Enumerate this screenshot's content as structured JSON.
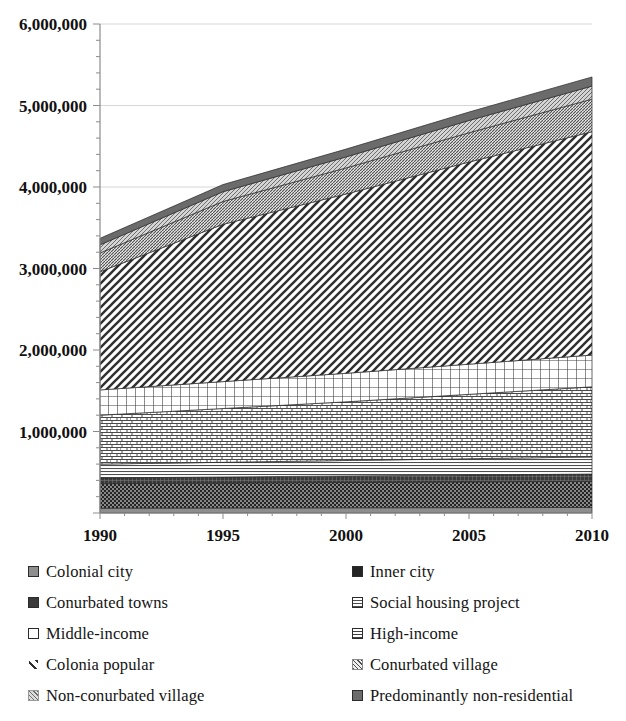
{
  "chart_data": {
    "type": "area",
    "stacked": true,
    "title": "",
    "xlabel": "",
    "ylabel": "",
    "x": [
      1990,
      1995,
      2000,
      2005,
      2010
    ],
    "xticklabels": [
      "1990",
      "1995",
      "2000",
      "2005",
      "2010"
    ],
    "yticklabels": [
      "1,000,000",
      "2,000,000",
      "3,000,000",
      "4,000,000",
      "5,000,000",
      "6,000,000"
    ],
    "ytickvalues": [
      1000000,
      2000000,
      3000000,
      4000000,
      5000000,
      6000000
    ],
    "ylim": [
      0,
      6000000
    ],
    "xlim": [
      1990,
      2010
    ],
    "grid": "horizontal",
    "legend_position": "bottom",
    "legend_columns": 2,
    "series": [
      {
        "name": "Colonial city",
        "pattern": "solid-gray",
        "color": "#7a7a7a",
        "values": [
          60000,
          62000,
          64000,
          66000,
          68000
        ]
      },
      {
        "name": "Inner city",
        "pattern": "dense-dark",
        "color": "#2b2b2b",
        "values": [
          300000,
          305000,
          310000,
          315000,
          320000
        ]
      },
      {
        "name": "Conurbated towns",
        "pattern": "dark-grid",
        "color": "#3c3c3c",
        "values": [
          70000,
          75000,
          80000,
          85000,
          90000
        ]
      },
      {
        "name": "Social housing project",
        "pattern": "horizontal-lines",
        "color": "#5a5a5a",
        "values": [
          170000,
          180000,
          190000,
          200000,
          210000
        ]
      },
      {
        "name": "Middle-income",
        "pattern": "brick",
        "color": "#8a8a8a",
        "values": [
          600000,
          660000,
          720000,
          790000,
          860000
        ]
      },
      {
        "name": "High-income",
        "pattern": "cross-grid",
        "color": "#6f6f6f",
        "values": [
          310000,
          330000,
          350000,
          370000,
          390000
        ]
      },
      {
        "name": "Colonia popular",
        "pattern": "diagonal-hatch",
        "color": "#4a4a4a",
        "values": [
          1450000,
          1930000,
          2200000,
          2480000,
          2740000
        ]
      },
      {
        "name": "Conurbated village",
        "pattern": "fine-diagonal",
        "color": "#777777",
        "values": [
          230000,
          280000,
          320000,
          360000,
          400000
        ]
      },
      {
        "name": "Non-conurbated village",
        "pattern": "light-diagonal",
        "color": "#9a9a9a",
        "values": [
          100000,
          120000,
          135000,
          150000,
          160000
        ]
      },
      {
        "name": "Predominantly non-residential",
        "pattern": "mid-gray",
        "color": "#606060",
        "values": [
          80000,
          88000,
          96000,
          104000,
          112000
        ]
      }
    ],
    "totals": [
      3370000,
      4030000,
      4465000,
      4920000,
      5350000
    ]
  },
  "legend": {
    "left_column": [
      {
        "label": "Colonial city",
        "swatch": "legend-swatch-colonial-city"
      },
      {
        "label": "Conurbated towns",
        "swatch": "legend-swatch-conurbated-towns"
      },
      {
        "label": "Middle-income",
        "swatch": "legend-swatch-middle-income"
      },
      {
        "label": "Colonia popular",
        "swatch": "legend-swatch-colonia-popular"
      },
      {
        "label": "Non-conurbated village",
        "swatch": "legend-swatch-non-conurbated-village"
      }
    ],
    "right_column": [
      {
        "label": "Inner city",
        "swatch": "legend-swatch-inner-city"
      },
      {
        "label": "Social housing project",
        "swatch": "legend-swatch-social-housing-project"
      },
      {
        "label": "High-income",
        "swatch": "legend-swatch-high-income"
      },
      {
        "label": "Conurbated village",
        "swatch": "legend-swatch-conurbated-village"
      },
      {
        "label": "Predominantly non-residential",
        "swatch": "legend-swatch-predominantly-non-residential"
      }
    ]
  },
  "colors": {
    "background": "#ffffff",
    "axis": "#8c8c8c",
    "gridline": "#d6d6d6",
    "text": "#141414"
  }
}
